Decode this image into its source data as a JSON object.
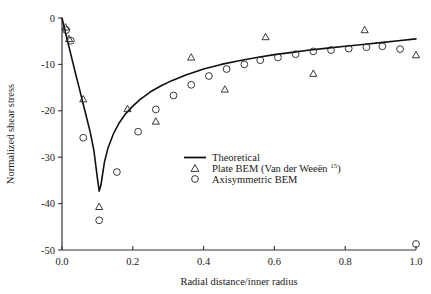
{
  "chart_data": {
    "type": "scatter",
    "title": "",
    "xlabel": "Radial distance/inner radius",
    "ylabel": "Normalized shear stress",
    "xlim": [
      0.0,
      1.0
    ],
    "ylim": [
      -50,
      0
    ],
    "xticks": [
      "0.0",
      "0.2",
      "0.4",
      "0.6",
      "0.8",
      "1.0"
    ],
    "xtick_values": [
      0.0,
      0.2,
      0.4,
      0.6,
      0.8,
      1.0
    ],
    "yticks": [
      "0",
      "-10",
      "-20",
      "-30",
      "-40",
      "-50"
    ],
    "ytick_values": [
      0,
      -10,
      -20,
      -30,
      -40,
      -50
    ],
    "grid": false,
    "legend_position": "center",
    "series": [
      {
        "name": "Theoretical",
        "marker": "line",
        "x": [
          0.0,
          0.005,
          0.01,
          0.015,
          0.02,
          0.03,
          0.04,
          0.05,
          0.06,
          0.07,
          0.08,
          0.09,
          0.1,
          0.105,
          0.11,
          0.12,
          0.13,
          0.145,
          0.16,
          0.18,
          0.2,
          0.22,
          0.25,
          0.28,
          0.31,
          0.35,
          0.4,
          0.45,
          0.5,
          0.55,
          0.6,
          0.65,
          0.7,
          0.75,
          0.8,
          0.85,
          0.9,
          0.95,
          1.0
        ],
        "y": [
          0.0,
          -1.6,
          -3.2,
          -4.8,
          -6.3,
          -9.4,
          -12.5,
          -15.5,
          -18.6,
          -21.6,
          -24.7,
          -28.5,
          -34.5,
          -37.3,
          -36.0,
          -31.0,
          -28.0,
          -25.0,
          -22.8,
          -20.6,
          -19.0,
          -17.6,
          -15.9,
          -14.6,
          -13.5,
          -12.3,
          -11.0,
          -10.0,
          -9.2,
          -8.5,
          -7.9,
          -7.4,
          -6.9,
          -6.5,
          -6.1,
          -5.7,
          -5.3,
          -4.9,
          -4.5
        ]
      },
      {
        "name": "Plate BEM (Van der Weeën 15)",
        "marker": "triangle",
        "x": [
          0.01,
          0.02,
          0.06,
          0.105,
          0.185,
          0.265,
          0.365,
          0.46,
          0.575,
          0.71,
          0.855,
          1.0
        ],
        "y": [
          -2.0,
          -4.5,
          -17.5,
          -40.7,
          -19.6,
          -22.3,
          -8.5,
          -15.4,
          -4.1,
          -12.0,
          -2.6,
          -8.0
        ]
      },
      {
        "name": "Axisymmetric BEM",
        "marker": "circle",
        "x": [
          0.012,
          0.025,
          0.06,
          0.105,
          0.155,
          0.215,
          0.265,
          0.315,
          0.365,
          0.415,
          0.465,
          0.515,
          0.56,
          0.61,
          0.66,
          0.71,
          0.76,
          0.81,
          0.86,
          0.905,
          0.955,
          1.0
        ],
        "y": [
          -2.6,
          -4.9,
          -25.8,
          -43.6,
          -33.2,
          -24.5,
          -19.7,
          -16.7,
          -14.4,
          -12.5,
          -11.0,
          -10.0,
          -9.1,
          -8.5,
          -7.8,
          -7.2,
          -6.9,
          -6.6,
          -6.3,
          -6.1,
          -6.7,
          -48.7
        ]
      }
    ],
    "legend": [
      {
        "label": "Theoretical",
        "marker": "line",
        "superscript": ""
      },
      {
        "label": "Plate BEM (Van der Weeën",
        "marker": "triangle",
        "superscript": "15",
        "suffix": ")"
      },
      {
        "label": "Axisymmetric BEM",
        "marker": "circle",
        "superscript": ""
      }
    ],
    "colors": {
      "line": "#111111",
      "marker_stroke": "#222222",
      "axis": "#333333",
      "background": "#ffffff"
    }
  }
}
